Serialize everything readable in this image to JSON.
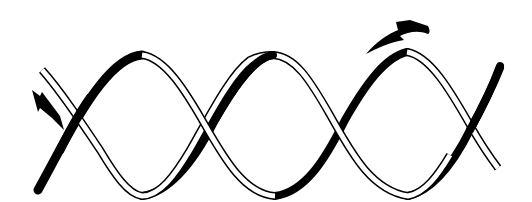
{
  "diagram": {
    "colors": {
      "background": "#ffffff",
      "ink": "#000000",
      "band_fill": "#ffffff"
    },
    "bands": [
      {
        "name": "black-band",
        "style": "solid filled"
      },
      {
        "name": "white-band",
        "style": "outlined"
      }
    ],
    "arrows": [
      {
        "name": "left-arrow",
        "direction": "down-right",
        "position": "left end"
      },
      {
        "name": "top-arrow",
        "direction": "curved up-left",
        "position": "above right crest"
      }
    ],
    "text": []
  }
}
